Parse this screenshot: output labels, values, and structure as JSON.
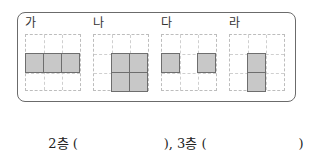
{
  "figures": [
    {
      "label": "가",
      "cells": [
        [
          1,
          0
        ],
        [
          1,
          1
        ],
        [
          1,
          2
        ]
      ]
    },
    {
      "label": "나",
      "cells": [
        [
          1,
          1
        ],
        [
          1,
          2
        ],
        [
          2,
          1
        ],
        [
          2,
          2
        ]
      ]
    },
    {
      "label": "다",
      "cells": [
        [
          1,
          0
        ],
        [
          1,
          2
        ]
      ]
    },
    {
      "label": "라",
      "cells": [
        [
          1,
          1
        ],
        [
          2,
          1
        ]
      ]
    }
  ],
  "answer": {
    "floor2_label": "2층 (",
    "close1": "),",
    "floor3_label": "3층 (",
    "close2": ")"
  },
  "colors": {
    "shade": "#c8c8c8",
    "border": "#6e6e6e",
    "frame": "#6b6b6b"
  }
}
